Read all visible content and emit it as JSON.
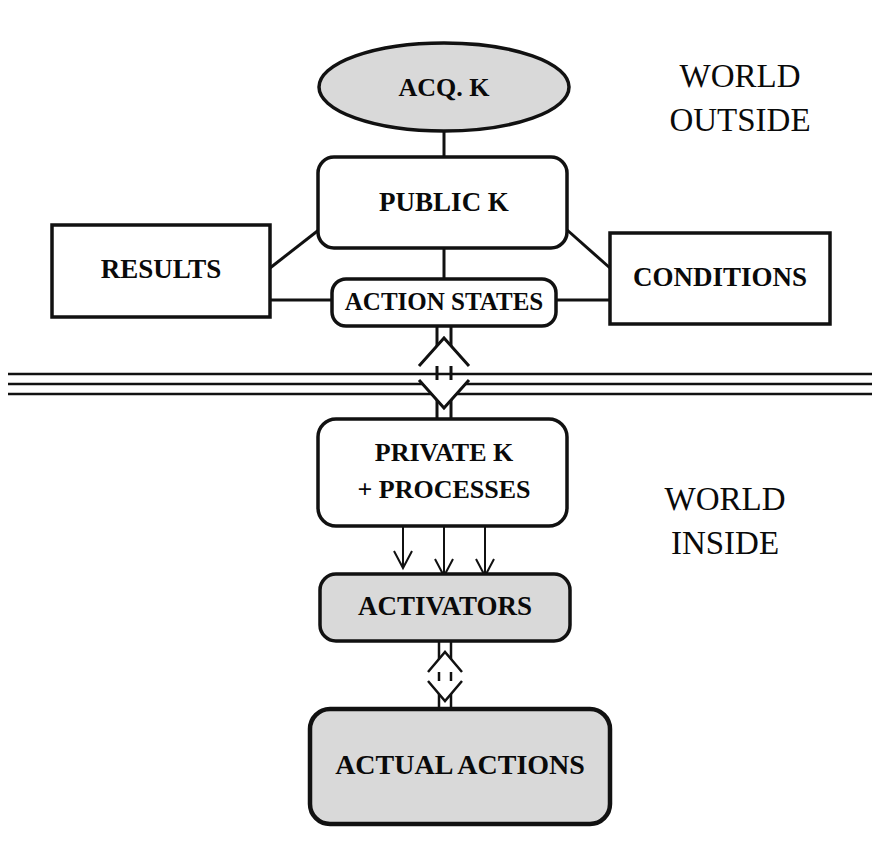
{
  "diagram": {
    "colors": {
      "stroke": "#111111",
      "white_fill": "#ffffff",
      "gray_fill": "#d9d9d9",
      "background": "#ffffff",
      "text": "#0a0a0a"
    },
    "regions": [
      {
        "id": "outside",
        "line1": "WORLD",
        "line2": "OUTSIDE"
      },
      {
        "id": "inside",
        "line1": "WORLD",
        "line2": "INSIDE"
      }
    ],
    "nodes": [
      {
        "id": "acq-k",
        "label": "ACQ. K",
        "shape": "ellipse",
        "fill": "gray"
      },
      {
        "id": "public-k",
        "label": "PUBLIC  K",
        "shape": "rounded-rectangle",
        "fill": "white"
      },
      {
        "id": "results",
        "label": "RESULTS",
        "shape": "rectangle",
        "fill": "white"
      },
      {
        "id": "conditions",
        "label": "CONDITIONS",
        "shape": "rectangle",
        "fill": "white"
      },
      {
        "id": "action-states",
        "label": "ACTION STATES",
        "shape": "rounded-rectangle",
        "fill": "white"
      },
      {
        "id": "private-k",
        "label_line1": "PRIVATE  K",
        "label_line2": "+ PROCESSES",
        "shape": "rounded-rectangle",
        "fill": "white"
      },
      {
        "id": "activators",
        "label": "ACTIVATORS",
        "shape": "rounded-rectangle",
        "fill": "gray"
      },
      {
        "id": "actual-actions",
        "label": "ACTUAL  ACTIONS",
        "shape": "rounded-rectangle",
        "fill": "gray"
      }
    ],
    "connectors": [
      {
        "from": "acq-k",
        "to": "public-k",
        "style": "plain-line",
        "direction": "none"
      },
      {
        "from": "results",
        "to": "public-k",
        "style": "diagonal-line",
        "direction": "none"
      },
      {
        "from": "conditions",
        "to": "public-k",
        "style": "diagonal-line",
        "direction": "none"
      },
      {
        "from": "results",
        "to": "action-states",
        "style": "plain-line",
        "direction": "none"
      },
      {
        "from": "conditions",
        "to": "action-states",
        "style": "plain-line",
        "direction": "none"
      },
      {
        "from": "public-k",
        "to": "action-states",
        "style": "plain-line",
        "direction": "none"
      },
      {
        "from": "action-states",
        "to": "private-k",
        "style": "hollow-double-arrow",
        "direction": "both"
      },
      {
        "from": "private-k",
        "to": "activators",
        "style": "triple-thin-arrow",
        "direction": "down"
      },
      {
        "from": "activators",
        "to": "actual-actions",
        "style": "hollow-double-arrow",
        "direction": "both"
      }
    ],
    "boundary": {
      "id": "world-boundary",
      "style": "triple-horizontal-line",
      "line_count": 3
    }
  }
}
